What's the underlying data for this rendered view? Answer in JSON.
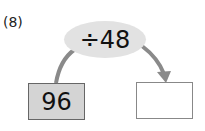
{
  "problem": {
    "label": "(8)",
    "operation": "÷48",
    "input_value": "96",
    "output_value": ""
  },
  "colors": {
    "oval_fill": "#e2e2e2",
    "input_box_fill": "#d4d4d4",
    "arrow": "#8a8a8a"
  }
}
